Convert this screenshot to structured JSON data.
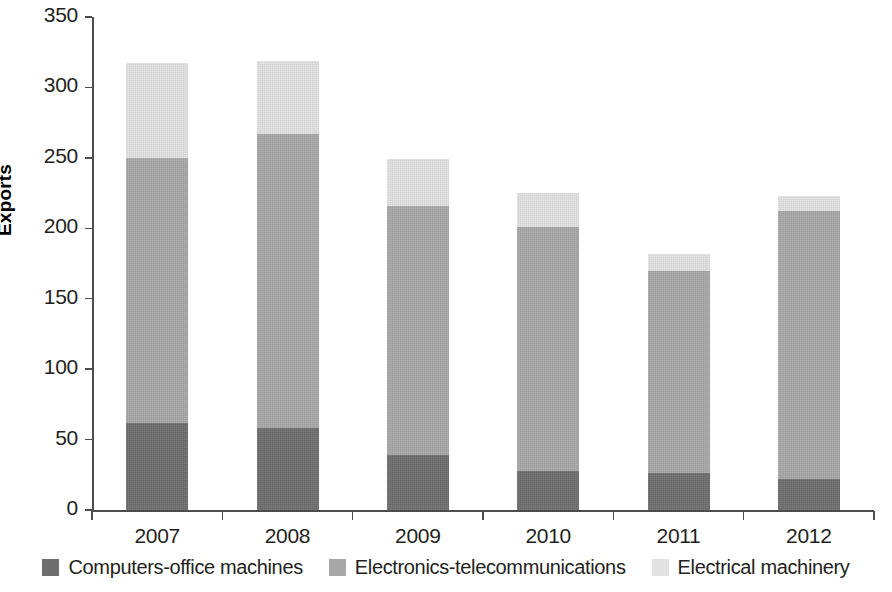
{
  "chart_data": {
    "type": "bar",
    "subtype": "stacked-bar",
    "title": "",
    "xlabel": "",
    "ylabel": "Exports",
    "categories": [
      "2007",
      "2008",
      "2009",
      "2010",
      "2011",
      "2012"
    ],
    "series": [
      {
        "name": "Computers-office machines",
        "color": "#6e6e6e",
        "values": [
          62,
          58,
          39,
          28,
          26,
          22
        ]
      },
      {
        "name": "Electronics-telecommunications",
        "color": "#a8a8a8",
        "values": [
          188,
          209,
          177,
          173,
          144,
          190
        ]
      },
      {
        "name": "Electrical machinery",
        "color": "#e2e2e2",
        "values": [
          67,
          52,
          33,
          24,
          12,
          11
        ]
      }
    ],
    "totals": [
      317,
      319,
      249,
      225,
      182,
      223
    ],
    "ylim": [
      0,
      350
    ],
    "y_ticks": [
      0,
      50,
      100,
      150,
      200,
      250,
      300,
      350
    ],
    "y_tick_labels": [
      "0",
      "50",
      "100",
      "150",
      "200",
      "250",
      "300",
      "350"
    ],
    "grid": false,
    "legend_position": "bottom"
  },
  "axis": {
    "y_title": "Exports"
  },
  "legend": {
    "items": [
      {
        "label": "Computers-office machines",
        "color": "#6e6e6e"
      },
      {
        "label": "Electronics-telecommunications",
        "color": "#a8a8a8"
      },
      {
        "label": "Electrical machinery",
        "color": "#e2e2e2"
      }
    ]
  }
}
